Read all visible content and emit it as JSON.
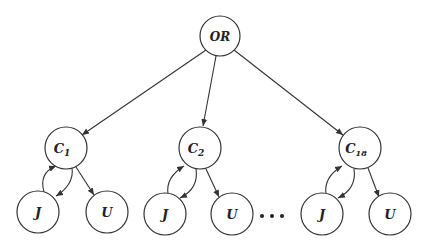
{
  "diagram": {
    "type": "tree",
    "stroke_color": "#333333",
    "background": "#ffffff",
    "root": {
      "id": "or",
      "label": "OR",
      "cx": 220,
      "cy": 36,
      "r": 20
    },
    "clauses": [
      {
        "id": "c1",
        "label": "C",
        "sub": "1",
        "cx": 66,
        "cy": 148,
        "r": 21,
        "children": [
          {
            "id": "j1",
            "label": "J",
            "cx": 38,
            "cy": 212,
            "r": 21
          },
          {
            "id": "u1",
            "label": "U",
            "cx": 107,
            "cy": 212,
            "r": 21
          }
        ]
      },
      {
        "id": "c2",
        "label": "C",
        "sub": "2",
        "cx": 200,
        "cy": 148,
        "r": 21,
        "children": [
          {
            "id": "j2",
            "label": "J",
            "cx": 165,
            "cy": 214,
            "r": 21
          },
          {
            "id": "u2",
            "label": "U",
            "cx": 232,
            "cy": 214,
            "r": 21
          }
        ]
      },
      {
        "id": "c18",
        "label": "C",
        "sub": "18",
        "cx": 360,
        "cy": 148,
        "r": 21,
        "children": [
          {
            "id": "j3",
            "label": "J",
            "cx": 322,
            "cy": 214,
            "r": 21
          },
          {
            "id": "u3",
            "label": "U",
            "cx": 390,
            "cy": 214,
            "r": 21
          }
        ]
      }
    ],
    "ellipsis": {
      "label": "• • •",
      "dots": [
        [
          262,
          216
        ],
        [
          272,
          216
        ],
        [
          282,
          216
        ]
      ]
    }
  },
  "labels": {
    "root": "OR",
    "c1_main": "C",
    "c1_sub": "1",
    "c2_main": "C",
    "c2_sub": "2",
    "c18_main": "C",
    "c18_sub": "18",
    "j": "J",
    "u": "U"
  }
}
